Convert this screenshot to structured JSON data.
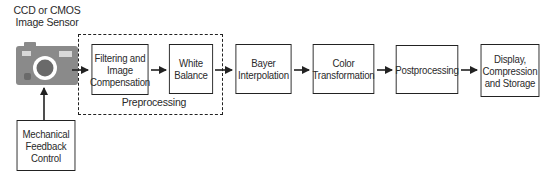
{
  "diagram": {
    "sensor_label": "CCD or CMOS\nImage Sensor",
    "sensor_icon": "camera-icon",
    "feedback_box": "Mechanical\nFeedback\nControl",
    "preprocessing_group_label": "Preprocessing",
    "blocks": [
      {
        "id": "filtering",
        "label": "Filtering and\nImage\nCompensation"
      },
      {
        "id": "white-balance",
        "label": "White\nBalance"
      },
      {
        "id": "bayer",
        "label": "Bayer\nInterpolation"
      },
      {
        "id": "color",
        "label": "Color\nTransformation"
      },
      {
        "id": "postprocessing",
        "label": "Postprocessing"
      },
      {
        "id": "display",
        "label": "Display,\nCompression\nand Storage"
      }
    ],
    "colors": {
      "camera_body": "#808080",
      "camera_lens_ring": "#ffffff",
      "camera_lens": "#6e6e6e",
      "line": "#222222"
    }
  }
}
